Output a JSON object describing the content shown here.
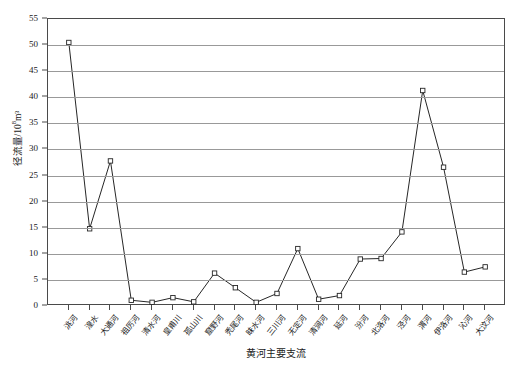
{
  "chart_data": {
    "type": "line",
    "title": "",
    "xlabel": "黄河主要支流",
    "ylabel": "径流量/10⁸m³",
    "ylabel_base": "径流量/10",
    "ylabel_exp": "8",
    "ylabel_tail": "m³",
    "ylim": [
      0,
      55
    ],
    "ytick_step": 5,
    "yticks": [
      0,
      5,
      10,
      15,
      20,
      25,
      30,
      35,
      40,
      45,
      50,
      55
    ],
    "grid": true,
    "legend": "none",
    "marker": "open-square",
    "line_color": "#262626",
    "grid_color": "#999999",
    "categories": [
      "洮河",
      "湟水",
      "大通河",
      "祖厉河",
      "清水河",
      "皇甫川",
      "孤山川",
      "窟野河",
      "秃尾河",
      "昧水河",
      "三川河",
      "无定河",
      "清涧河",
      "延河",
      "汾河",
      "北洛河",
      "泾河",
      "渭河",
      "伊洛河",
      "沁河",
      "大汶河"
    ],
    "values": [
      50.5,
      14.8,
      27.8,
      1.1,
      0.7,
      1.6,
      0.8,
      6.3,
      3.5,
      0.7,
      2.4,
      11.0,
      1.3,
      2.0,
      9.0,
      9.1,
      14.2,
      41.3,
      26.6,
      6.5,
      7.5
    ]
  }
}
